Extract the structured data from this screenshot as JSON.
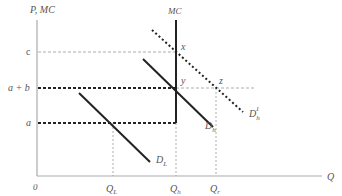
{
  "diagram": {
    "type": "economics-supply-demand",
    "y_axis_label": "P, MC",
    "x_axis_label": "Q",
    "origin_label": "0",
    "price_levels": {
      "c": "c",
      "a_plus_b": "a + b",
      "a": "a"
    },
    "quantity_labels": {
      "q_l": "Q",
      "q_l_sub": "L",
      "q_h": "Q",
      "q_h_sub": "h",
      "q_r": "Q",
      "q_r_sub": "r"
    },
    "curves": {
      "mc": "MC",
      "d_l": "D",
      "d_l_sub": "L",
      "d_h": "D",
      "d_h_sub": "h",
      "d_h1": "D",
      "d_h1_sub": "h",
      "d_h1_sup": "1"
    },
    "points": {
      "x": "x",
      "y": "y",
      "z": "z"
    },
    "colors": {
      "axis": "#aaaaaa",
      "curve": "#222222",
      "guide": "#999999",
      "label": "#555555"
    }
  }
}
